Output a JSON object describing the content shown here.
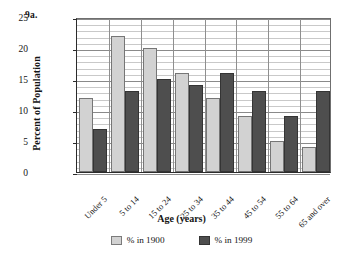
{
  "figure": {
    "number_label": "9a."
  },
  "chart_data": {
    "type": "bar",
    "title": "",
    "xlabel": "Age (years)",
    "ylabel": "Percent of Population",
    "categories": [
      "Under 5",
      "5 to 14",
      "15 to 24",
      "25 to 34",
      "35 to 44",
      "45 to 54",
      "55 to 64",
      "65 and over"
    ],
    "series": [
      {
        "name": "% in 1900",
        "color": "#d2d2d2",
        "values": [
          12,
          22,
          20,
          16,
          12,
          9,
          5,
          4
        ]
      },
      {
        "name": "% in 1999",
        "color": "#4e4e4e",
        "values": [
          7,
          13,
          15,
          14,
          16,
          13,
          9,
          13
        ]
      }
    ],
    "ylim": [
      0,
      25
    ],
    "ytick_labels": [
      "0",
      "5",
      "10",
      "15",
      "20",
      "25"
    ],
    "ytick_values": [
      0,
      5,
      10,
      15,
      20,
      25
    ],
    "minor_tick_step": 1,
    "grid": true,
    "legend_position": "bottom"
  }
}
